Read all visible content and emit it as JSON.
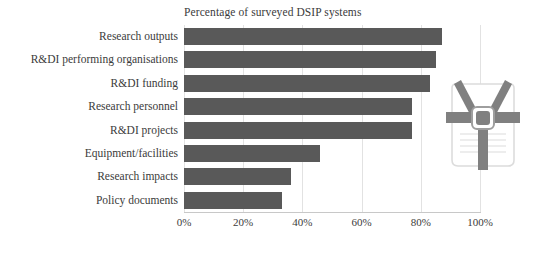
{
  "chart_data": {
    "type": "bar",
    "orientation": "horizontal",
    "title": "Percentage of surveyed DSIP systems",
    "xlabel": "",
    "ylabel": "",
    "categories": [
      "Research outputs",
      "R&DI performing organisations",
      "R&DI funding",
      "Research personnel",
      "R&DI projects",
      "Equipment/facilities",
      "Research impacts",
      "Policy documents"
    ],
    "values": [
      87,
      85,
      83,
      77,
      77,
      46,
      36,
      33
    ],
    "xlim": [
      0,
      100
    ],
    "xticks": [
      0,
      20,
      40,
      60,
      80,
      100
    ],
    "xtick_labels": [
      "0%",
      "20%",
      "40%",
      "60%",
      "80%",
      "100%"
    ],
    "grid": "vertical",
    "legend": "none",
    "bar_color": "#595959",
    "gridline_color": "#E2E2E2",
    "axis_color": "#C8C8C8",
    "text_color": "#3B3B3B"
  },
  "icon": {
    "name": "backpack-harness-icon",
    "color": "#7F7F7F",
    "outline_color": "#D9D9D9"
  }
}
